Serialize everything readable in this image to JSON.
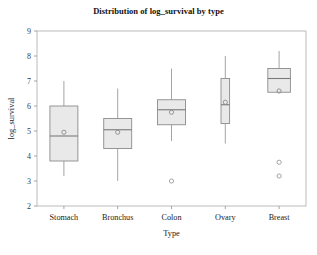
{
  "chart_data": {
    "type": "box",
    "title": "Distribution of log_survival by type",
    "xlabel": "Type",
    "ylabel": "log_survival",
    "categories": [
      "Stomach",
      "Bronchus",
      "Colon",
      "Ovary",
      "Breast"
    ],
    "ylim": [
      2,
      9
    ],
    "yticks": [
      2,
      3,
      4,
      5,
      6,
      7,
      8,
      9
    ],
    "ytick_labels": [
      "2",
      "3",
      "4",
      "5",
      "6",
      "7",
      "8",
      "9"
    ],
    "grid": false,
    "legend": false,
    "box_fill_color": "#e9e9e9",
    "box_edge_color": "#8c8c8c",
    "whisker_color": "#9a9a9a",
    "median_color": "#7a7a7a",
    "mean_marker": "circle-open",
    "outlier_marker": "circle-open",
    "boxes": [
      {
        "category": "Stomach",
        "whisker_low": 3.2,
        "q1": 3.8,
        "median": 4.8,
        "q3": 6.0,
        "whisker_high": 7.0,
        "mean": 4.95,
        "outliers": []
      },
      {
        "category": "Bronchus",
        "whisker_low": 3.0,
        "q1": 4.3,
        "median": 5.05,
        "q3": 5.5,
        "whisker_high": 6.7,
        "mean": 4.95,
        "outliers": []
      },
      {
        "category": "Colon",
        "whisker_low": 4.6,
        "q1": 5.25,
        "median": 5.85,
        "q3": 6.25,
        "whisker_high": 7.5,
        "mean": 5.75,
        "outliers": [
          3.0
        ]
      },
      {
        "category": "Ovary",
        "whisker_low": 4.5,
        "q1": 5.3,
        "median": 6.05,
        "q3": 7.1,
        "whisker_high": 8.0,
        "mean": 6.15,
        "outliers": []
      },
      {
        "category": "Breast",
        "whisker_low": 6.55,
        "q1": 6.55,
        "median": 7.1,
        "q3": 7.5,
        "whisker_high": 8.2,
        "mean": 6.6,
        "outliers": [
          3.75,
          3.2
        ]
      }
    ]
  },
  "axes": {
    "frame_color": "#b4b4b4",
    "tick_color": "#9a9a9a"
  }
}
